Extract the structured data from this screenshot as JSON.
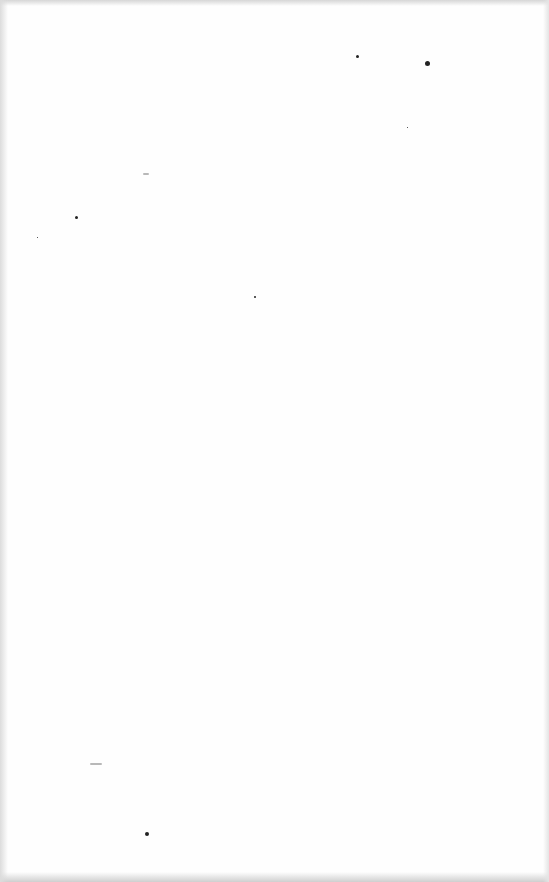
{
  "page": {
    "type": "blank-scanned-page",
    "background_color": "#fefefe",
    "edge_shadow_color": "#d6d6d6",
    "content_text": ""
  },
  "artifacts": {
    "specks": [
      {
        "x": 425,
        "y": 61,
        "size": 5
      },
      {
        "x": 356,
        "y": 55,
        "size": 3
      },
      {
        "x": 75,
        "y": 216,
        "size": 3
      },
      {
        "x": 254,
        "y": 296,
        "size": 2
      },
      {
        "x": 145,
        "y": 832,
        "size": 4
      },
      {
        "x": 407,
        "y": 127,
        "size": 1
      },
      {
        "x": 37,
        "y": 237,
        "size": 1
      }
    ],
    "smudges": [
      {
        "x": 90,
        "y": 763,
        "width": 12
      },
      {
        "x": 143,
        "y": 173,
        "width": 6
      }
    ]
  }
}
